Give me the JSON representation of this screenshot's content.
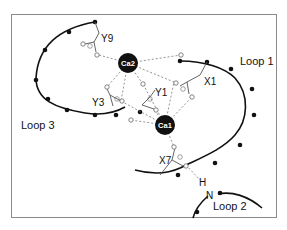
{
  "diagram": {
    "loops": [
      {
        "id": "loop1",
        "label": "Loop 1"
      },
      {
        "id": "loop2",
        "label": "Loop 2"
      },
      {
        "id": "loop3",
        "label": "Loop 3"
      }
    ],
    "ions": [
      {
        "id": "ca1",
        "label": "Ca1"
      },
      {
        "id": "ca2",
        "label": "Ca2"
      }
    ],
    "residues": [
      {
        "id": "y9",
        "label": "Y9"
      },
      {
        "id": "x1",
        "label": "X1"
      },
      {
        "id": "y1",
        "label": "Y1"
      },
      {
        "id": "y3",
        "label": "Y3"
      },
      {
        "id": "x7",
        "label": "X7"
      }
    ],
    "atoms": {
      "hydrogen": "H",
      "nitrogen": "N"
    }
  }
}
